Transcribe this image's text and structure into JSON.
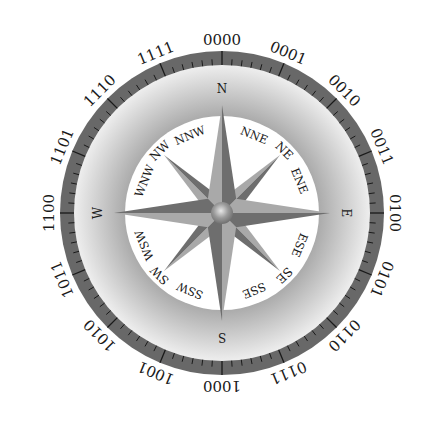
{
  "diagram": {
    "type": "compass-rose",
    "center": {
      "x": 222,
      "y": 213
    },
    "outer_ring": {
      "outer_radius": 162,
      "inner_radius": 148,
      "color": "#686868",
      "tick_color": "#1a1a1a",
      "divisions": 96,
      "major_every": 6
    },
    "gradient_band": {
      "outer_color": "#eeeeee",
      "inner_color": "#a4a4a4"
    },
    "inner_disc": {
      "radius": 97,
      "color": "#ffffff"
    },
    "binary_labels": [
      "0000",
      "0001",
      "0010",
      "0011",
      "0100",
      "0101",
      "0110",
      "0111",
      "1000",
      "1001",
      "1010",
      "1011",
      "1100",
      "1101",
      "1110",
      "1111"
    ],
    "cardinal_labels": [
      "N",
      "E",
      "S",
      "W"
    ],
    "intercardinal_labels": [
      "NE",
      "SE",
      "SW",
      "NW"
    ],
    "secondary_labels": [
      "NNE",
      "ENE",
      "ESE",
      "SSE",
      "SSW",
      "WSW",
      "WNW",
      "NNW"
    ],
    "colors": {
      "point_light": "#a9a9a9",
      "point_dark": "#6e6e6e",
      "hub_light": "#e0e0e0",
      "hub_dark": "#808080"
    }
  }
}
